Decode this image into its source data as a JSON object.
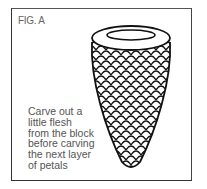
{
  "figure": {
    "label": "FIG. A",
    "caption_lines": [
      "Carve out a",
      "little flesh",
      "from the block",
      "before carving",
      "the next layer",
      "of petals"
    ],
    "illustration": "cone-shaped block with scale-like petal pattern and open oval top",
    "colors": {
      "border": "#333333",
      "text": "#555555",
      "line": "#111111"
    }
  }
}
